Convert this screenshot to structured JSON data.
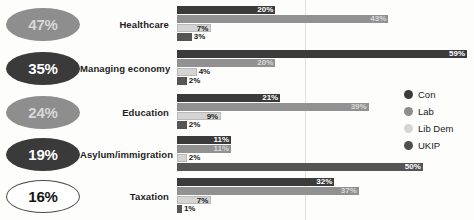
{
  "chart_data": {
    "type": "bar",
    "orientation": "horizontal",
    "title": "",
    "xlabel": "",
    "ylabel": "",
    "xlim": [
      0,
      60
    ],
    "grid": true,
    "legend_position": "right",
    "categories": [
      "Healthcare",
      "Managing economy",
      "Education",
      "Asylum/immigration",
      "Taxation"
    ],
    "series": [
      {
        "name": "Con",
        "color": "#3b3b3b",
        "values": [
          20,
          59,
          21,
          11,
          32
        ]
      },
      {
        "name": "Lab",
        "color": "#919191",
        "values": [
          43,
          20,
          39,
          11,
          37
        ]
      },
      {
        "name": "Lib Dem",
        "color": "#d4d4d4",
        "values": [
          7,
          4,
          9,
          2,
          7
        ]
      },
      {
        "name": "UKIP",
        "color": "#555555",
        "values": [
          3,
          2,
          2,
          50,
          1
        ]
      }
    ],
    "value_labels": [
      [
        "20%",
        "43%",
        "7%",
        "3%"
      ],
      [
        "59%",
        "20%",
        "4%",
        "2%"
      ],
      [
        "21%",
        "39%",
        "9%",
        "2%"
      ],
      [
        "11%",
        "11%",
        "2%",
        "50%"
      ],
      [
        "32%",
        "37%",
        "7%",
        "1%"
      ]
    ]
  },
  "badges": [
    {
      "value": "47%",
      "tone": "tone-mid",
      "label": "Healthcare"
    },
    {
      "value": "35%",
      "tone": "tone-dark",
      "label": "Managing economy"
    },
    {
      "value": "24%",
      "tone": "tone-mid",
      "label": "Education"
    },
    {
      "value": "19%",
      "tone": "tone-dark",
      "label": "Asylum/immigration"
    },
    {
      "value": "16%",
      "tone": "tone-light",
      "label": "Taxation"
    }
  ],
  "legend": {
    "items": [
      {
        "label": "Con",
        "swatch": "p-con"
      },
      {
        "label": "Lab",
        "swatch": "p-lab"
      },
      {
        "label": "Lib Dem",
        "swatch": "p-lib"
      },
      {
        "label": "UKIP",
        "swatch": "p-ukip"
      }
    ]
  }
}
